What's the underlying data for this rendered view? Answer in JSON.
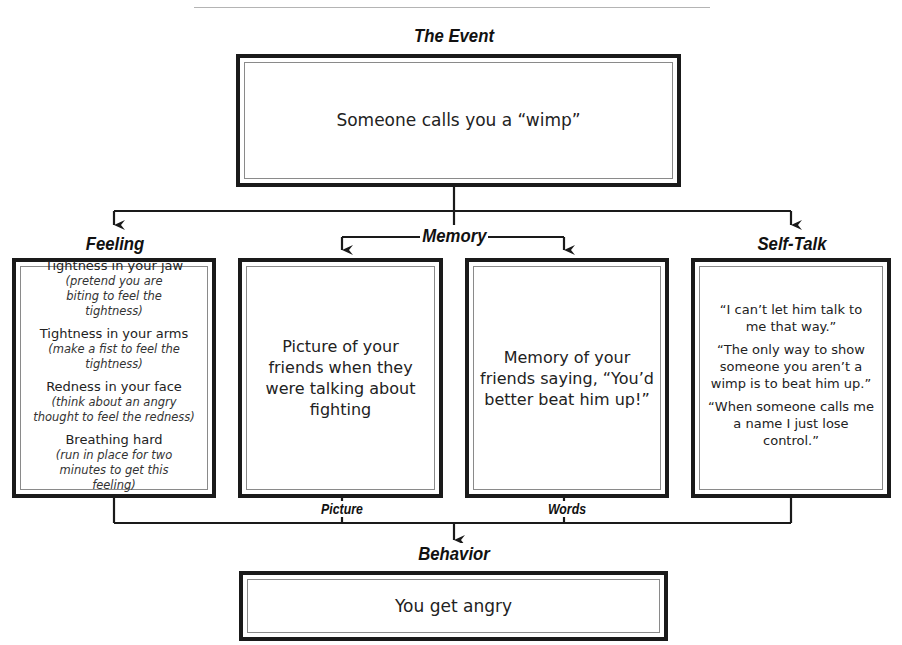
{
  "event": {
    "heading": "The Event",
    "text": "Someone calls you a “wimp”"
  },
  "feeling": {
    "heading": "Feeling",
    "items": [
      {
        "title": "Tightness in your jaw",
        "note": "(pretend you are biting to feel the tightness)"
      },
      {
        "title": "Tightness in your arms",
        "note": "(make a fist to feel the tightness)"
      },
      {
        "title": "Redness in your face",
        "note": "(think about an angry thought to feel the redness)"
      },
      {
        "title": "Breathing hard",
        "note": "(run in place for two minutes to get this feeling)"
      }
    ]
  },
  "memory": {
    "heading": "Memory",
    "picture": {
      "label": "Picture",
      "text": "Picture of your friends when they were talking about fighting"
    },
    "words": {
      "label": "Words",
      "text": "Memory of your friends saying, “You’d better beat him up!”"
    }
  },
  "self_talk": {
    "heading": "Self-Talk",
    "items": [
      "“I can’t let him talk to me that way.”",
      "“The only way to show someone you aren’t a wimp is to beat him up.”",
      "“When someone calls me a name I just lose control.”"
    ]
  },
  "behavior": {
    "heading": "Behavior",
    "text": "You get angry"
  },
  "colors": {
    "line": "#1a1a1a",
    "inner_border": "#8a8a8a",
    "rule": "#b4b4b4"
  }
}
